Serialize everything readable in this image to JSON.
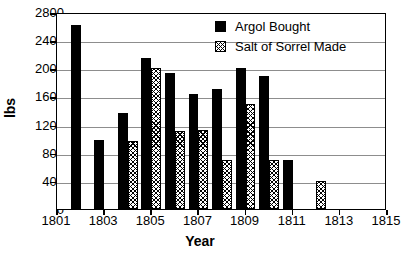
{
  "chart_data": {
    "type": "bar",
    "title": "",
    "xlabel": "Year",
    "ylabel": "lbs",
    "ylim": [
      0,
      2800
    ],
    "ytick_values": [
      0,
      400,
      800,
      1200,
      1600,
      2000,
      2400,
      2800
    ],
    "ytick_labels": [
      "0",
      "400",
      "800",
      "1200",
      "1600",
      "2000",
      "2400",
      "2800"
    ],
    "xlim": [
      1801,
      1815
    ],
    "xtick_values": [
      1801,
      1803,
      1805,
      1807,
      1809,
      1811,
      1813,
      1815
    ],
    "xtick_labels": [
      "1801",
      "1803",
      "1805",
      "1807",
      "1809",
      "1811",
      "1813",
      "1815"
    ],
    "categories": [
      1801,
      1802,
      1803,
      1804,
      1805,
      1806,
      1807,
      1808,
      1809,
      1810,
      1811,
      1812,
      1813,
      1814,
      1815
    ],
    "grid": "horizontal",
    "legend_position": "upper-right",
    "series": [
      {
        "name": "Argol Bought",
        "pattern": "solid-black",
        "color": "#000000",
        "values": [
          null,
          2620,
          980,
          1360,
          2140,
          1940,
          1630,
          1700,
          2010,
          1890,
          690,
          null,
          null,
          null,
          null
        ]
      },
      {
        "name": "Salt of Sorrel Made",
        "pattern": "diagonal-hatch",
        "color": "#000000",
        "values": [
          null,
          null,
          null,
          960,
          2010,
          1110,
          1120,
          690,
          1490,
          690,
          null,
          400,
          null,
          null,
          null
        ]
      }
    ]
  },
  "legend": {
    "items": [
      {
        "label": "Argol Bought"
      },
      {
        "label": "Salt of Sorrel Made"
      }
    ]
  }
}
